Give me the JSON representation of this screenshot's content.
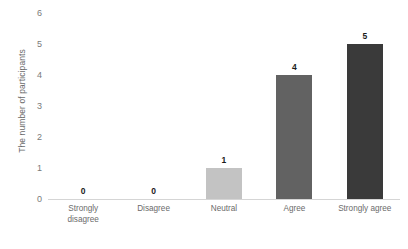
{
  "chart_data": {
    "type": "bar",
    "title": "",
    "subtitle": "",
    "xlabel": "",
    "ylabel": "The number of participants",
    "categories": [
      "Strongly disagree",
      "Disagree",
      "Neutral",
      "Agree",
      "Strongly agree"
    ],
    "category_lines": [
      [
        "Strongly",
        "disagree"
      ],
      [
        "Disagree"
      ],
      [
        "Neutral"
      ],
      [
        "Agree"
      ],
      [
        "Strongly agree"
      ]
    ],
    "values": [
      0,
      0,
      1,
      4,
      5
    ],
    "value_labels": [
      "0",
      "0",
      "1",
      "4",
      "5"
    ],
    "bar_colors": [
      "#c3c3c3",
      "#c3c3c3",
      "#c3c3c3",
      "#626262",
      "#3a3a3a"
    ],
    "ylim": [
      0,
      6
    ],
    "yticks": [
      0,
      1,
      2,
      3,
      4,
      5,
      6
    ],
    "ytick_labels": [
      "0",
      "1",
      "2",
      "3",
      "4",
      "5",
      "6"
    ],
    "grid": false,
    "legend": false,
    "legend_position": "none",
    "axis_color": "#d5d5d5",
    "tick_label_color": "#7a7a7a",
    "axis_title_color": "#6b6b6b",
    "data_label_color": "#1a1a1a",
    "background": "#ffffff"
  }
}
